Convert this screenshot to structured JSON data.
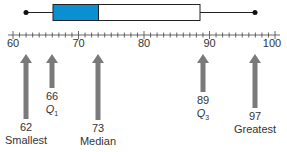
{
  "chart_data": {
    "type": "boxplot",
    "title": "",
    "xlabel": "",
    "ylabel": "",
    "xlim": [
      60,
      100
    ],
    "major_ticks": [
      60,
      70,
      80,
      90,
      100
    ],
    "minor_tick_step": 1,
    "five_number_summary": {
      "min": 62,
      "q1": 66,
      "median": 73,
      "q3": 89,
      "max": 97
    },
    "annotations": [
      {
        "value": 62,
        "label": "Smallest"
      },
      {
        "value": 66,
        "label": "Q1"
      },
      {
        "value": 73,
        "label": "Median"
      },
      {
        "value": 89,
        "label": "Q3"
      },
      {
        "value": 97,
        "label": "Greatest"
      }
    ],
    "colors": {
      "lower_box": "#0a8fd0",
      "upper_box": "#ffffff",
      "arrow": "#777777"
    }
  },
  "labels": {
    "tick_60": "60",
    "tick_70": "70",
    "tick_80": "80",
    "tick_90": "90",
    "tick_100": "100",
    "min_value": "62",
    "min_name": "Smallest",
    "q1_value": "66",
    "q1_name": "Q",
    "q1_sub": "1",
    "median_value": "73",
    "median_name": "Median",
    "q3_value": "89",
    "q3_name": "Q",
    "q3_sub": "3",
    "max_value": "97",
    "max_name": "Greatest"
  }
}
